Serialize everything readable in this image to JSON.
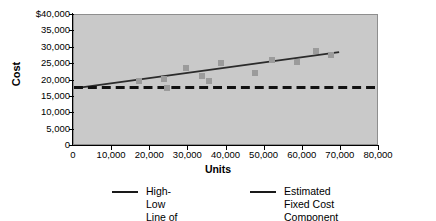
{
  "chart_data": {
    "type": "scatter",
    "title": "",
    "xlabel": "Units",
    "ylabel": "Cost",
    "xlim": [
      0,
      80000
    ],
    "ylim": [
      0,
      40000
    ],
    "grid": false,
    "legend_position": "bottom",
    "x_ticks": [
      "0",
      "10,000",
      "20,000",
      "30,000",
      "40,000",
      "50,000",
      "60,000",
      "70,000",
      "80,000"
    ],
    "x_tick_values": [
      0,
      10000,
      20000,
      30000,
      40000,
      50000,
      60000,
      70000,
      80000
    ],
    "y_ticks": [
      "0",
      "5,000",
      "10,000",
      "15,000",
      "20,000",
      "25,000",
      "30,000",
      "35,000",
      "$40,000"
    ],
    "y_tick_values": [
      0,
      5000,
      10000,
      15000,
      20000,
      25000,
      30000,
      35000,
      40000
    ],
    "series": [
      {
        "name": "Observed cost points",
        "type": "scatter",
        "marker": "square",
        "color": "#9b9b9b",
        "points": [
          {
            "x": 17000,
            "y": 19700
          },
          {
            "x": 23500,
            "y": 20400
          },
          {
            "x": 24500,
            "y": 17800
          },
          {
            "x": 29500,
            "y": 23700
          },
          {
            "x": 33500,
            "y": 21500
          },
          {
            "x": 35500,
            "y": 19700
          },
          {
            "x": 38500,
            "y": 25200
          },
          {
            "x": 47500,
            "y": 22300
          },
          {
            "x": 52000,
            "y": 26400
          },
          {
            "x": 58500,
            "y": 25500
          },
          {
            "x": 63500,
            "y": 29100
          },
          {
            "x": 67500,
            "y": 27700
          }
        ]
      },
      {
        "name": "High-Low Line of Cost Behavior",
        "type": "line",
        "style": "solid",
        "color": "#2b2b2b",
        "points": [
          {
            "x": 2000,
            "y": 17525
          },
          {
            "x": 70000,
            "y": 28500
          }
        ]
      },
      {
        "name": "Estimated Fixed Cost Component ($17,525)",
        "type": "line",
        "style": "dashed",
        "color": "#111111",
        "value": 17525,
        "points": [
          {
            "x": 0,
            "y": 17525
          },
          {
            "x": 80000,
            "y": 17525
          }
        ]
      }
    ]
  },
  "axes": {
    "y_title": "Cost",
    "x_title": "Units"
  },
  "legend": {
    "items": [
      {
        "label": "High-Low Line of\nCost Behavior",
        "style": "solid",
        "color": "#1a1a1a"
      },
      {
        "label": "Estimated Fixed Cost\nComponent ($17,525)",
        "style": "solid",
        "color": "#1a1a1a"
      }
    ]
  },
  "colors": {
    "plot_background": "#c9c9c9",
    "plot_border": "#8e8e8e",
    "marker": "#9b9b9b",
    "trend_line": "#2b2b2b",
    "fixed_cost_line": "#111111",
    "text": "#000000"
  }
}
